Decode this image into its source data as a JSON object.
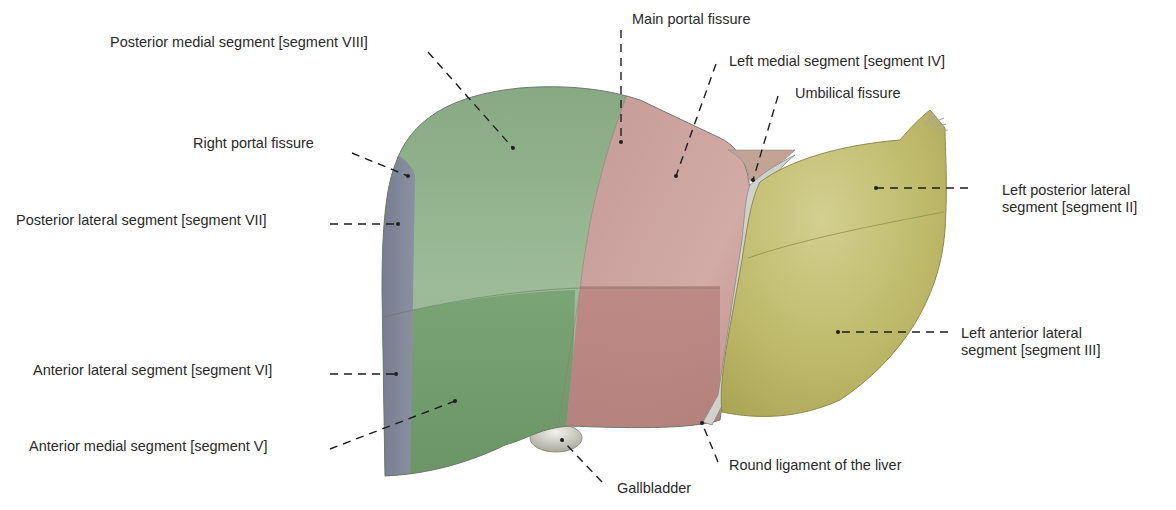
{
  "figure": {
    "colors": {
      "background": "#ffffff",
      "posterior_lateral_strip": "#7d8496",
      "right_green_upper": "#8fae8a",
      "right_green_lower": "#6f9a6a",
      "left_medial_red_upper": "#c79a97",
      "left_medial_red_lower": "#b5807c",
      "left_lateral_olive": "#b9b562",
      "left_lateral_olive_light": "#cfcb86",
      "ligament_gray": "#c9c9c4",
      "gallbladder": "#cfcfc6",
      "leader_line": "#1e1e1e"
    }
  },
  "labels": [
    {
      "id": "seg8",
      "text": "Posterior medial segment [segment VIII]"
    },
    {
      "id": "main_portal",
      "text": "Main portal fissure"
    },
    {
      "id": "seg4",
      "text": "Left medial segment [segment IV]"
    },
    {
      "id": "umbilical",
      "text": "Umbilical fissure"
    },
    {
      "id": "right_portal",
      "text": "Right portal fissure"
    },
    {
      "id": "seg7",
      "text": "Posterior lateral segment [segment VII]"
    },
    {
      "id": "seg2_line1",
      "text": "Left posterior lateral"
    },
    {
      "id": "seg2_line2",
      "text": "segment [segment II]"
    },
    {
      "id": "seg3_line1",
      "text": "Left anterior lateral"
    },
    {
      "id": "seg3_line2",
      "text": "segment [segment III]"
    },
    {
      "id": "seg6",
      "text": "Anterior lateral segment [segment VI]"
    },
    {
      "id": "seg5",
      "text": "Anterior medial segment [segment V]"
    },
    {
      "id": "round_ligament",
      "text": "Round ligament of the liver"
    },
    {
      "id": "gallbladder",
      "text": "Gallbladder"
    }
  ]
}
